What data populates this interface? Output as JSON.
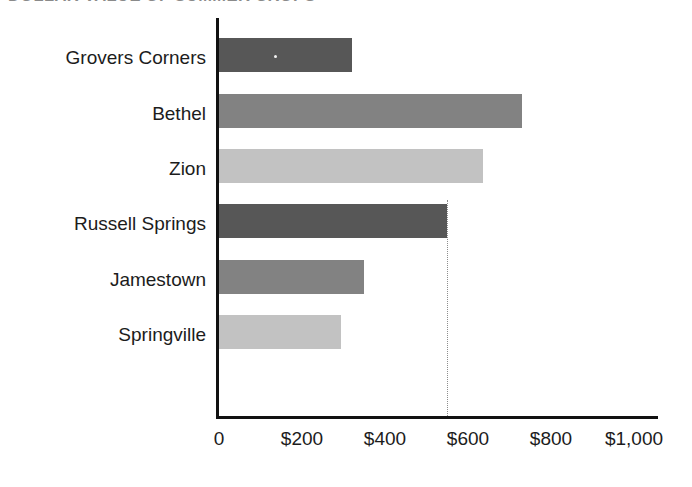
{
  "chart_data": {
    "type": "bar",
    "orientation": "horizontal",
    "title": "DOLLAR VALUE OF SUMMER CROPS",
    "xlabel": "",
    "ylabel": "",
    "categories": [
      "Grovers Corners",
      "Bethel",
      "Zion",
      "Russell Springs",
      "Jamestown",
      "Springville"
    ],
    "values": [
      320,
      730,
      635,
      550,
      350,
      295
    ],
    "value_prefix": "$",
    "xlim": [
      0,
      1000
    ],
    "xticks": [
      0,
      200,
      400,
      600,
      800,
      1000
    ],
    "xtick_labels": [
      "0",
      "$200",
      "$400",
      "$600",
      "$800",
      "$1,000"
    ],
    "grid": false,
    "legend": "none",
    "bar_colors": [
      "#575757",
      "#828282",
      "#c2c2c2",
      "#575757",
      "#828282",
      "#c2c2c2"
    ],
    "annotations": [
      {
        "type": "dotted-vertical-line",
        "at_value": 550,
        "from_category": "Russell Springs",
        "color": "#8d8d8d"
      }
    ]
  },
  "axis": {
    "spine_color": "#111111"
  }
}
